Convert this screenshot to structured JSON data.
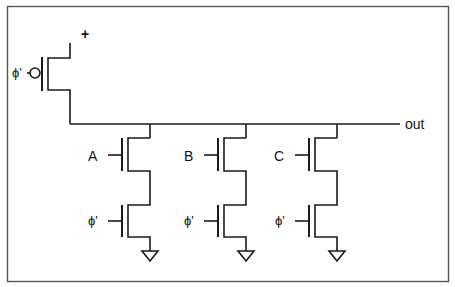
{
  "diagram": {
    "type": "dynamic CMOS NOR gate schematic",
    "supply_label": "+",
    "output_label": "out",
    "precharge": {
      "gate_label": "ϕ'",
      "device": "PMOS"
    },
    "pulldown_branches": [
      {
        "input_label": "A",
        "clock_label": "ϕ'"
      },
      {
        "input_label": "B",
        "clock_label": "ϕ'"
      },
      {
        "input_label": "C",
        "clock_label": "ϕ'"
      }
    ],
    "colors": {
      "line": "#1a1a1a",
      "frame": "#555555",
      "background": "#ffffff"
    }
  }
}
